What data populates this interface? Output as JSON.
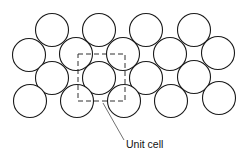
{
  "diagram": {
    "circle_radius": 16.5,
    "stroke_color": "#1a1a1a",
    "rows": [
      {
        "name": "row-1",
        "centers": [
          [
            52,
            30
          ],
          [
            99,
            30
          ],
          [
            146,
            30
          ],
          [
            194,
            30
          ]
        ]
      },
      {
        "name": "row-2",
        "centers": [
          [
            29,
            55
          ],
          [
            76,
            54
          ],
          [
            123,
            54
          ],
          [
            170,
            54
          ],
          [
            218,
            53
          ]
        ]
      },
      {
        "name": "row-3",
        "centers": [
          [
            52,
            78
          ],
          [
            99,
            78
          ],
          [
            146,
            78
          ],
          [
            194,
            77
          ]
        ]
      },
      {
        "name": "row-4",
        "centers": [
          [
            30,
            101
          ],
          [
            77,
            101
          ],
          [
            124,
            101
          ],
          [
            171,
            101
          ],
          [
            219,
            98
          ]
        ]
      }
    ],
    "unit_cell": {
      "x": 78,
      "y": 54,
      "width": 47,
      "height": 47
    },
    "leader_line": {
      "x1": 103,
      "y1": 103,
      "x2": 124,
      "y2": 140
    },
    "label": "Unit cell"
  }
}
